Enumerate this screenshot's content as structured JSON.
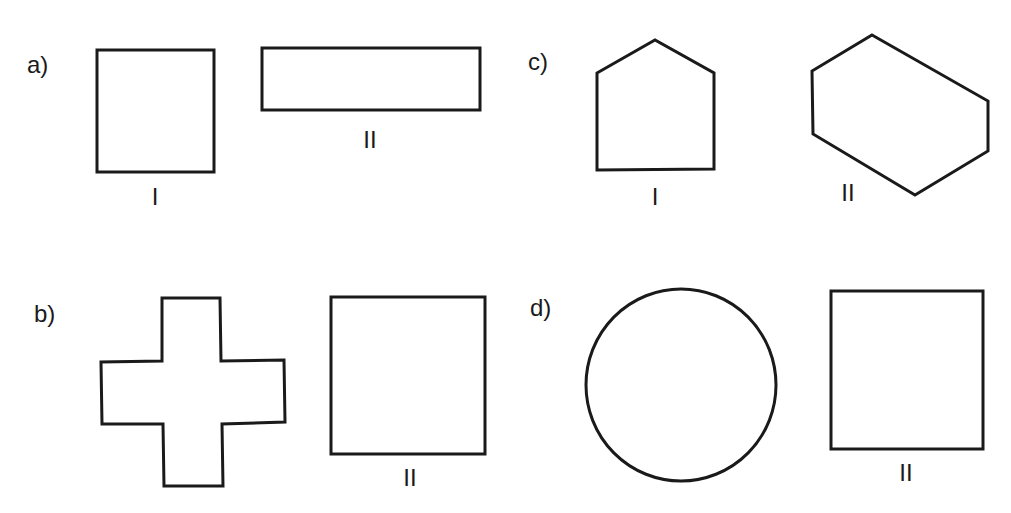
{
  "panels": [
    {
      "id": "a",
      "label": "a)",
      "figures": [
        {
          "numeral": "I",
          "shape": "square"
        },
        {
          "numeral": "II",
          "shape": "rectangle"
        }
      ]
    },
    {
      "id": "b",
      "label": "b)",
      "figures": [
        {
          "numeral": "",
          "shape": "cross"
        },
        {
          "numeral": "II",
          "shape": "square"
        }
      ]
    },
    {
      "id": "c",
      "label": "c)",
      "figures": [
        {
          "numeral": "I",
          "shape": "pentagon"
        },
        {
          "numeral": "II",
          "shape": "hexagon"
        }
      ]
    },
    {
      "id": "d",
      "label": "d)",
      "figures": [
        {
          "numeral": "",
          "shape": "circle"
        },
        {
          "numeral": "II",
          "shape": "square"
        }
      ]
    }
  ],
  "colors": {
    "stroke": "#1a1a1a",
    "background": "#ffffff"
  }
}
